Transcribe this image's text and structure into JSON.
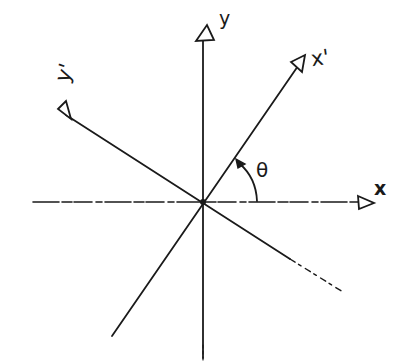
{
  "diagram": {
    "labels": {
      "y_axis": "y",
      "x_axis": "x",
      "x_prime_axis": "x'",
      "y_prime_axis": "y'",
      "angle": "θ"
    },
    "origin": [
      203,
      202
    ],
    "axes": [
      {
        "name": "x",
        "from": [
          33,
          202
        ],
        "to": [
          372,
          202
        ],
        "style": "dashed-light",
        "arrow": "open-triangle"
      },
      {
        "name": "y",
        "from": [
          203,
          360
        ],
        "to": [
          203,
          36
        ],
        "style": "solid",
        "arrow": "open-triangle"
      },
      {
        "name": "x'",
        "from": [
          112,
          336
        ],
        "to": [
          300,
          64
        ],
        "style": "solid",
        "arrow": "open-triangle"
      },
      {
        "name": "y'",
        "from": [
          343,
          292
        ],
        "to": [
          60,
          111
        ],
        "style": "solid",
        "arrow": "open-triangle"
      }
    ],
    "angle_arc": {
      "label": "θ",
      "from_axis": "x",
      "to_axis": "x'"
    },
    "colors": {
      "ink": "#1a1a1a",
      "background": "#ffffff"
    }
  }
}
